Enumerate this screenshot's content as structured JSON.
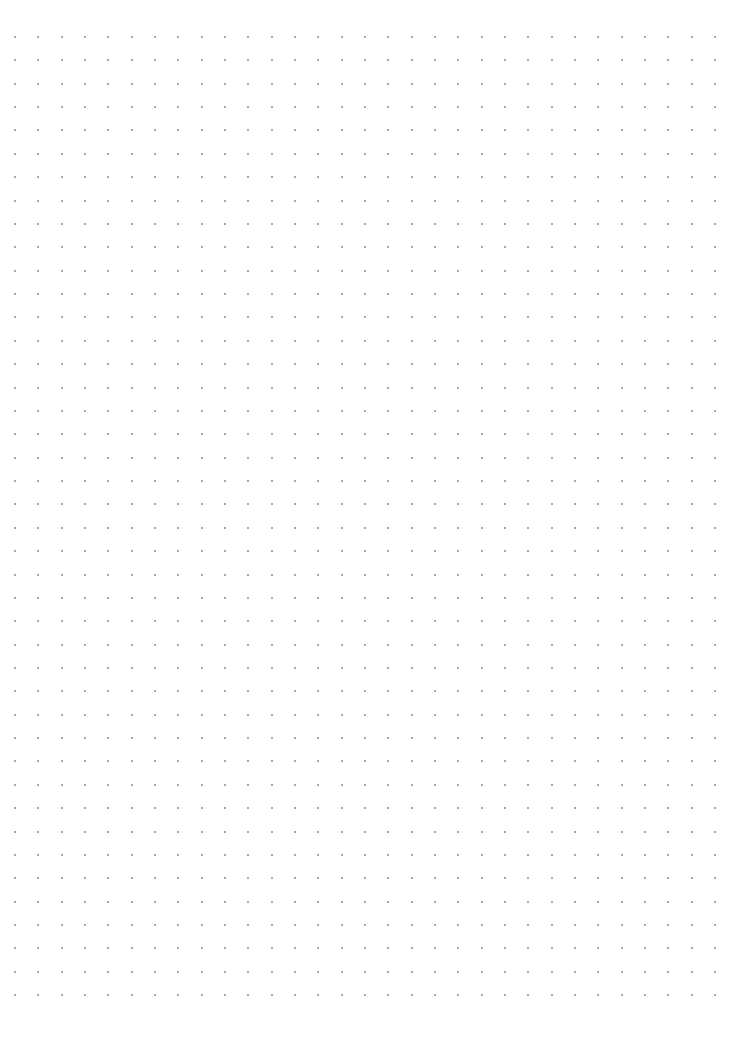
{
  "page": {
    "type": "dot-grid-paper",
    "background": "#ffffff"
  },
  "grid": {
    "columns": 31,
    "rows": 42,
    "origin_x": 15,
    "origin_y": 37,
    "spacing_x": 23.33,
    "spacing_y": 23.37,
    "dot_size": 2,
    "dot_color": "#8a8a8a"
  }
}
